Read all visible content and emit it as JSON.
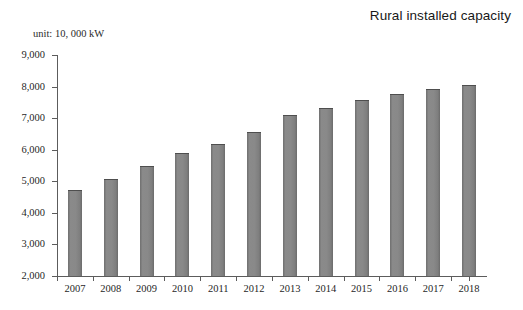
{
  "chart_data": {
    "type": "bar",
    "title": "Rural installed capacity",
    "unit_note": "unit: 10, 000 kW",
    "xlabel": "",
    "ylabel": "",
    "categories": [
      "2007",
      "2008",
      "2009",
      "2010",
      "2011",
      "2012",
      "2013",
      "2014",
      "2015",
      "2016",
      "2017",
      "2018"
    ],
    "values": [
      4710,
      5080,
      5480,
      5900,
      6190,
      6560,
      7100,
      7330,
      7580,
      7780,
      7930,
      8050
    ],
    "ylim": [
      2000,
      9000
    ],
    "ytick_values": [
      2000,
      3000,
      4000,
      5000,
      6000,
      7000,
      8000,
      9000
    ],
    "ytick_labels": [
      "2,000",
      "3,000",
      "4,000",
      "5,000",
      "6,000",
      "7,000",
      "8,000",
      "9,000"
    ],
    "grid": false,
    "legend": null,
    "series_color": "#868686",
    "axis_color": "#5c5c5c"
  }
}
